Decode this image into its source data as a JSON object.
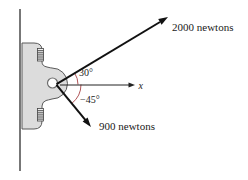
{
  "figure": {
    "colors": {
      "background": "#ffffff",
      "bracket_fill": "#dcdcdc",
      "bracket_stroke": "#5a5a5a",
      "force_arrow": "#111111",
      "angle_arc": "#b05558",
      "wall": "#4a4a4a",
      "text": "#1a1a1a"
    },
    "forces": [
      {
        "label": "2000 newtons",
        "angle_deg": 30
      },
      {
        "label": "900 newtons",
        "angle_deg": -45
      }
    ],
    "angles": [
      {
        "label": "30°",
        "value_deg": 30
      },
      {
        "label": "−45°",
        "value_deg": -45
      }
    ],
    "axis": {
      "label": "x"
    }
  }
}
